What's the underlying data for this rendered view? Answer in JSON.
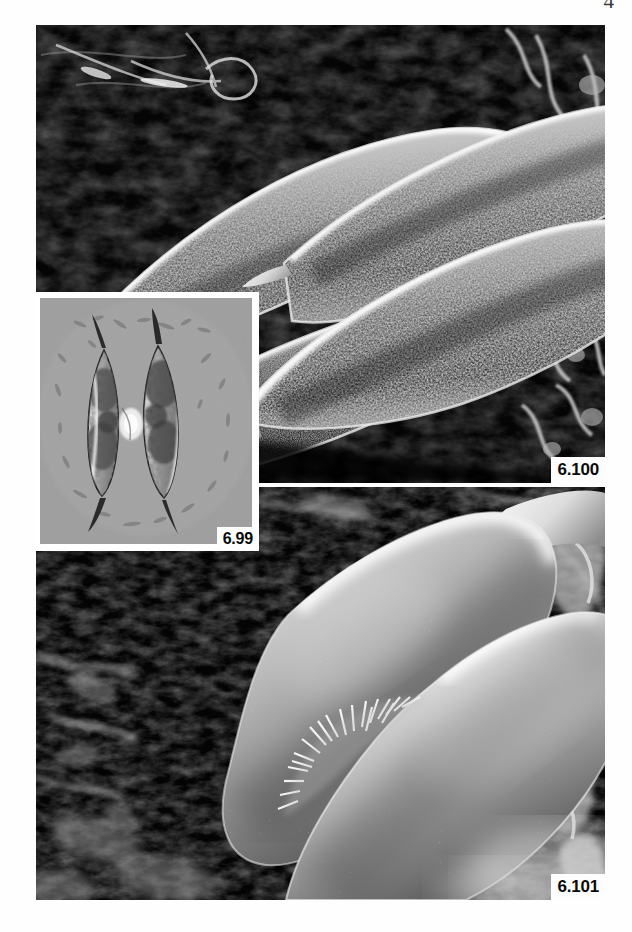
{
  "page": {
    "folio": "4",
    "background_color": "#ffffff"
  },
  "plate": {
    "figures": [
      {
        "id": "6.100",
        "label": "6.100",
        "kind": "scanning-electron-micrograph",
        "background_color": "#000000",
        "description": "Four spindle-shaped (fusiform) cells with coarsely granular, warty surface texture and tapered spine-like apical processes, arranged in two overlapping diagonal pairs on a dark, porous substrate.",
        "cell_count": 4,
        "surface_texture": "granular-warty",
        "label_position": "bottom-right"
      },
      {
        "id": "6.99",
        "label": "6.99",
        "kind": "light-micrograph-dic",
        "background_color": "#9a9a9a",
        "description": "Differential-interference-contrast light micrograph of two conjugating fusiform cells joined mid-body, each with long pointed apical spines and dark granular chloroplast contents.",
        "cell_count": 2,
        "surface_texture": "smooth-optical",
        "label_position": "bottom-right",
        "is_inset": true,
        "border_color": "#ffffff"
      },
      {
        "id": "6.101",
        "label": "6.101",
        "kind": "scanning-electron-micrograph",
        "background_color": "#000000",
        "description": "High-magnification view of two large smooth-walled cells meeting at a conjugation papilla, surfaces dotted with fine bright granules and a tuft of short spiky fibrils at the junction.",
        "cell_count": 2,
        "surface_texture": "smooth-speckled",
        "label_position": "bottom-right"
      }
    ]
  },
  "colors": {
    "paper": "#ffffff",
    "sem_background": "#000000",
    "lm_background": "#9a9a9a",
    "label_box": "#fdfdfd",
    "label_text": "#0a0a0a",
    "folio_text": "#3a3a3a"
  }
}
